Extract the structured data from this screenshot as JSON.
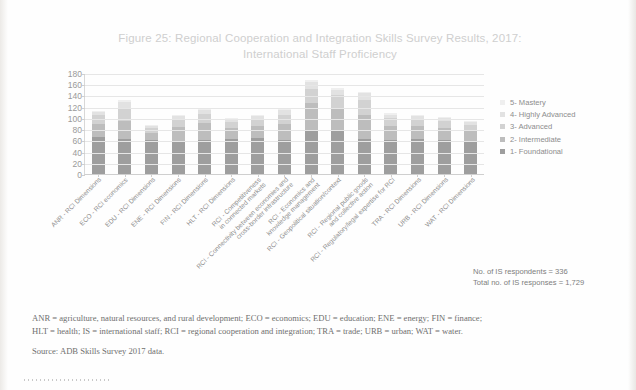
{
  "figure": {
    "title_line1": "Figure 25: Regional Cooperation and Integration Skills Survey Results, 2017:",
    "title_line2": "International Staff Proficiency"
  },
  "stats": {
    "respondents": "No. of IS respondents = 336",
    "responses": "Total no. of IS responses = 1,729"
  },
  "footnote": {
    "line1": "ANR = agriculture, natural resources, and rural development; ECO = economics; EDU = education; ENE = energy; FIN = finance;",
    "line2": "HLT = health; IS = international staff; RCI = regional cooperation and integration; TRA = trade; URB = urban; WAT = water.",
    "source": "Source: ADB Skills Survey 2017 data."
  },
  "colors": {
    "level5": "#efefef",
    "level4": "#e2e2e2",
    "level3": "#d2d2d2",
    "level2": "#bdbdbd",
    "level1": "#9e9e9e",
    "grid": "#e6e6e6",
    "axis": "#cfcfcf",
    "text": "#8d8d8d",
    "title": "#cfcfcf"
  },
  "chart_data": {
    "type": "bar",
    "stacked": true,
    "title": "Figure 25: Regional Cooperation and Integration Skills Survey Results, 2017: International Staff Proficiency",
    "xlabel": "",
    "ylabel": "",
    "ylim": [
      0,
      180
    ],
    "yticks": [
      0,
      20,
      40,
      60,
      80,
      100,
      120,
      140,
      160,
      180
    ],
    "grid": true,
    "legend_position": "right",
    "categories": [
      "ANR - RCI Dimensions",
      "ECO - RCI economics",
      "EDU - RCI Dimensions",
      "ENE - RCI Dimensions",
      "FIN - RCI Dimensions",
      "HLT - RCI Dimensions",
      "RCI - Competitiveness in connected markets",
      "RCI - Connectivity between economies and cross-border infrastructure",
      "RCI - Economics and knowledge management",
      "RCI - Geopolitical situation/context",
      "RCI - Regional public goods and collective action",
      "RCI - Regulatory/legal expertise for RCI",
      "TRA - RCI Dimensions",
      "URB - RCI Dimensions",
      "WAT - RCI Dimensions"
    ],
    "category_lines": [
      [
        "ANR - RCI Dimensions"
      ],
      [
        "ECO - RCI economics"
      ],
      [
        "EDU - RCI Dimensions"
      ],
      [
        "ENE - RCI Dimensions"
      ],
      [
        "FIN - RCI Dimensions"
      ],
      [
        "HLT - RCI Dimensions"
      ],
      [
        "RCI - Competitiveness",
        "in connected markets"
      ],
      [
        "RCI - Connectivity between economies and",
        "cross-border infrastructure"
      ],
      [
        "RCI - Economics and",
        "knowledge management"
      ],
      [
        "RCI - Geopolitical situation/context"
      ],
      [
        "RCI - Regional public goods",
        "and collective action"
      ],
      [
        "RCI - Regulatory/legal expertise for RCI"
      ],
      [
        "TRA - RCI Dimensions"
      ],
      [
        "URB - RCI Dimensions"
      ],
      [
        "WAT - RCI Dimensions"
      ]
    ],
    "series": [
      {
        "name": "1- Foundational",
        "color": "#9e9e9e",
        "values": [
          66,
          62,
          60,
          58,
          61,
          62,
          64,
          60,
          78,
          78,
          62,
          60,
          62,
          60,
          58
        ]
      },
      {
        "name": "2- Intermediate",
        "color": "#bdbdbd",
        "values": [
          24,
          32,
          14,
          26,
          30,
          20,
          22,
          30,
          48,
          40,
          44,
          26,
          24,
          22,
          20
        ]
      },
      {
        "name": "3- Advanced",
        "color": "#d2d2d2",
        "values": [
          15,
          22,
          8,
          14,
          16,
          10,
          12,
          16,
          26,
          22,
          26,
          14,
          12,
          12,
          10
        ]
      },
      {
        "name": "4- Highly Advanced",
        "color": "#e2e2e2",
        "values": [
          6,
          12,
          4,
          6,
          7,
          5,
          6,
          8,
          12,
          10,
          12,
          6,
          6,
          5,
          5
        ]
      },
      {
        "name": "5- Mastery",
        "color": "#efefef",
        "values": [
          2,
          4,
          2,
          2,
          2,
          2,
          2,
          2,
          3,
          3,
          3,
          2,
          2,
          2,
          2
        ]
      }
    ],
    "legend_entries": [
      {
        "label": "5- Mastery",
        "color": "#efefef"
      },
      {
        "label": "4- Highly Advanced",
        "color": "#e2e2e2"
      },
      {
        "label": "3- Advanced",
        "color": "#d2d2d2"
      },
      {
        "label": "2- Intermediate",
        "color": "#bdbdbd"
      },
      {
        "label": "1- Foundational",
        "color": "#9e9e9e"
      }
    ]
  }
}
